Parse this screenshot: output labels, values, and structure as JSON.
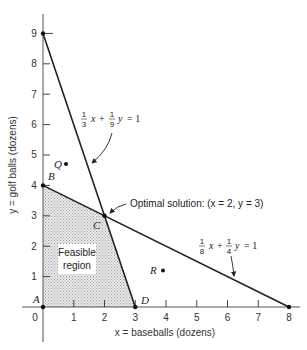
{
  "figure": {
    "x_axis": {
      "label": "x = baseballs (dozens)",
      "ticks": [
        "0",
        "1",
        "2",
        "3",
        "4",
        "5",
        "6",
        "7",
        "8"
      ]
    },
    "y_axis": {
      "label": "y = golf balls (dozens)",
      "ticks": [
        "1",
        "2",
        "3",
        "4",
        "5",
        "6",
        "7",
        "8",
        "9"
      ]
    },
    "constraints": [
      {
        "name": "constraint-1",
        "coef_x_num": "1",
        "coef_x_den": "3",
        "coef_y_num": "1",
        "coef_y_den": "9",
        "x_var": "x",
        "plus": "+",
        "y_var": "y",
        "equals": "= 1",
        "from": [
          0,
          9
        ],
        "to": [
          3,
          0
        ]
      },
      {
        "name": "constraint-2",
        "coef_x_num": "1",
        "coef_x_den": "8",
        "coef_y_num": "1",
        "coef_y_den": "4",
        "x_var": "x",
        "plus": "+",
        "y_var": "y",
        "equals": "= 1",
        "from": [
          0,
          4
        ],
        "to": [
          8,
          0
        ]
      }
    ],
    "points": [
      {
        "label": "A",
        "x": 0,
        "y": 0
      },
      {
        "label": "B",
        "x": 0,
        "y": 4
      },
      {
        "label": "C",
        "x": 2,
        "y": 3
      },
      {
        "label": "D",
        "x": 3,
        "y": 0
      },
      {
        "label": "Q",
        "x": 0.75,
        "y": 4.7
      },
      {
        "label": "R",
        "x": 3.9,
        "y": 1.2
      }
    ],
    "optimal_annotation": "Optimal solution: (x = 2, y = 3)",
    "feasible_region": {
      "line1": "Feasible",
      "line2": "region",
      "vertices": [
        [
          0,
          0
        ],
        [
          0,
          4
        ],
        [
          2,
          3
        ],
        [
          3,
          0
        ]
      ],
      "fill_color": "#c8c8c8"
    },
    "line_color": "#222222"
  }
}
